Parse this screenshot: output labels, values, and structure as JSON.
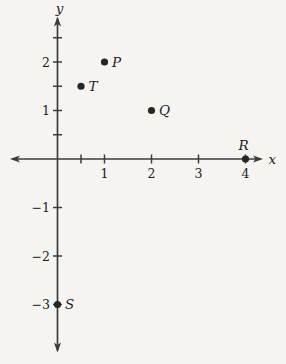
{
  "chart_data": {
    "type": "scatter",
    "title": "",
    "xlabel": "x",
    "ylabel": "y",
    "xlim": [
      -1,
      4.4
    ],
    "ylim": [
      -4,
      2.95
    ],
    "grid": false,
    "legend": null,
    "points": [
      {
        "label": "P",
        "x": 1,
        "y": 2,
        "label_position": "right"
      },
      {
        "label": "T",
        "x": 0.5,
        "y": 1.5,
        "label_position": "right"
      },
      {
        "label": "Q",
        "x": 2,
        "y": 1,
        "label_position": "right"
      },
      {
        "label": "R",
        "x": 4,
        "y": 0,
        "label_position": "above"
      },
      {
        "label": "S",
        "x": 0,
        "y": -3,
        "label_position": "right"
      }
    ],
    "x_axis": {
      "labeled_ticks": [
        {
          "value": 1,
          "label": "1"
        },
        {
          "value": 2,
          "label": "2"
        },
        {
          "value": 3,
          "label": "3"
        },
        {
          "value": 4,
          "label": "4"
        }
      ],
      "unlabeled_ticks": [
        0.5
      ]
    },
    "y_axis": {
      "labeled_ticks": [
        {
          "value": 2,
          "label": "2"
        },
        {
          "value": 1,
          "label": "1"
        },
        {
          "value": -1,
          "label": "−1"
        },
        {
          "value": -2,
          "label": "−2"
        },
        {
          "value": -3,
          "label": "−3"
        }
      ],
      "unlabeled_ticks": [
        2.5,
        1.5,
        0.5
      ]
    },
    "colors": {
      "background": "#f5f4f1",
      "axis": "#3c3c3c",
      "point": "#262626",
      "text": "#1d1d1d"
    }
  }
}
